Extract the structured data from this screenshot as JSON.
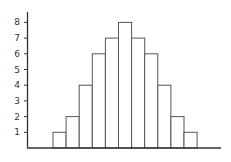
{
  "chart_data": {
    "type": "bar",
    "title": "",
    "xlabel": "",
    "ylabel": "",
    "categories": [
      "1",
      "2",
      "3",
      "4",
      "5",
      "6",
      "7",
      "8",
      "9",
      "10",
      "11"
    ],
    "values": [
      1,
      2,
      4,
      6,
      7,
      8,
      7,
      6,
      4,
      2,
      1
    ],
    "ylim": [
      0,
      8
    ],
    "yticks": [
      1,
      2,
      3,
      4,
      5,
      6,
      7,
      8
    ],
    "grid": false,
    "legend": null,
    "bar_fill": "#ffffff",
    "bar_stroke": "#555555"
  }
}
